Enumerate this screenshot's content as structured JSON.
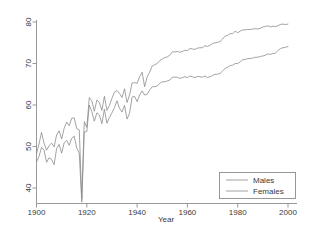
{
  "chart_data": {
    "type": "line",
    "title": "",
    "xlabel": "Year",
    "ylabel": "",
    "xlim": [
      1900,
      2000
    ],
    "ylim": [
      36,
      81
    ],
    "grid": false,
    "legend_position": "bottom-right",
    "xticks": [
      "1900",
      "1920",
      "1940",
      "1960",
      "1980",
      "2000"
    ],
    "xtick_values": [
      1900,
      1920,
      1940,
      1960,
      1980,
      2000
    ],
    "yticks": [
      "40",
      "50",
      "60",
      "70",
      "80"
    ],
    "ytick_values": [
      40,
      50,
      60,
      70,
      80
    ],
    "x": [
      1900,
      1901,
      1902,
      1903,
      1904,
      1905,
      1906,
      1907,
      1908,
      1909,
      1910,
      1911,
      1912,
      1913,
      1914,
      1915,
      1916,
      1917,
      1918,
      1919,
      1920,
      1921,
      1922,
      1923,
      1924,
      1925,
      1926,
      1927,
      1928,
      1929,
      1930,
      1931,
      1932,
      1933,
      1934,
      1935,
      1936,
      1937,
      1938,
      1939,
      1940,
      1941,
      1942,
      1943,
      1944,
      1945,
      1946,
      1947,
      1948,
      1949,
      1950,
      1951,
      1952,
      1953,
      1954,
      1955,
      1956,
      1957,
      1958,
      1959,
      1960,
      1961,
      1962,
      1963,
      1964,
      1965,
      1966,
      1967,
      1968,
      1969,
      1970,
      1971,
      1972,
      1973,
      1974,
      1975,
      1976,
      1977,
      1978,
      1979,
      1980,
      1981,
      1982,
      1983,
      1984,
      1985,
      1986,
      1987,
      1988,
      1989,
      1990,
      1991,
      1992,
      1993,
      1994,
      1995,
      1996,
      1997,
      1998,
      1999,
      2000
    ],
    "series": [
      {
        "name": "Males",
        "color": "#8b8b8b",
        "values": [
          46.3,
          47.6,
          49.8,
          49.1,
          46.2,
          47.3,
          46.9,
          45.6,
          49.5,
          50.5,
          48.4,
          50.9,
          51.5,
          50.3,
          52.0,
          52.5,
          49.6,
          48.4,
          36.6,
          53.5,
          53.6,
          60.0,
          58.4,
          56.1,
          58.1,
          57.6,
          55.5,
          59.0,
          55.6,
          57.0,
          58.1,
          59.4,
          61.0,
          59.2,
          58.3,
          59.9,
          56.6,
          58.0,
          61.9,
          62.1,
          60.8,
          62.4,
          63.4,
          62.4,
          62.6,
          63.6,
          64.4,
          64.4,
          64.6,
          65.2,
          65.6,
          65.6,
          65.8,
          66.0,
          66.7,
          66.7,
          66.7,
          66.4,
          66.6,
          66.8,
          66.6,
          67.0,
          66.8,
          66.6,
          66.9,
          66.8,
          66.7,
          67.0,
          66.6,
          66.8,
          67.1,
          67.4,
          67.4,
          67.6,
          68.2,
          68.8,
          69.1,
          69.5,
          69.6,
          70.0,
          70.0,
          70.4,
          70.9,
          71.0,
          71.2,
          71.2,
          71.3,
          71.5,
          71.5,
          71.7,
          71.8,
          72.0,
          72.3,
          72.2,
          72.4,
          72.5,
          73.1,
          73.6,
          73.8,
          73.9,
          74.1
        ]
      },
      {
        "name": "Females",
        "color": "#8b8b8b",
        "values": [
          48.3,
          50.6,
          53.4,
          50.8,
          49.1,
          50.2,
          50.8,
          49.9,
          52.8,
          53.8,
          51.8,
          54.4,
          55.9,
          55.0,
          56.8,
          56.9,
          54.3,
          54.0,
          37.4,
          56.0,
          54.6,
          61.8,
          61.0,
          58.5,
          61.2,
          60.6,
          58.7,
          62.1,
          58.7,
          59.9,
          61.6,
          63.1,
          63.5,
          62.8,
          61.8,
          63.9,
          60.6,
          62.4,
          65.3,
          65.4,
          65.2,
          66.8,
          67.9,
          64.4,
          66.8,
          67.9,
          69.4,
          69.7,
          70.0,
          70.7,
          71.1,
          71.4,
          71.6,
          72.0,
          72.8,
          72.8,
          72.9,
          72.7,
          72.9,
          73.2,
          73.1,
          73.6,
          73.5,
          73.4,
          73.7,
          73.8,
          73.8,
          74.3,
          74.1,
          74.4,
          74.8,
          75.0,
          75.1,
          75.3,
          75.9,
          76.6,
          76.8,
          77.2,
          77.2,
          77.8,
          77.4,
          77.8,
          78.1,
          78.1,
          78.2,
          78.2,
          78.3,
          78.4,
          78.3,
          78.5,
          78.8,
          78.9,
          79.1,
          78.8,
          79.0,
          78.9,
          79.1,
          79.4,
          79.5,
          79.4,
          79.5
        ]
      }
    ]
  },
  "legend": {
    "items": [
      {
        "label": "Males"
      },
      {
        "label": "Females"
      }
    ]
  },
  "axes": {
    "x_title": "Year"
  }
}
